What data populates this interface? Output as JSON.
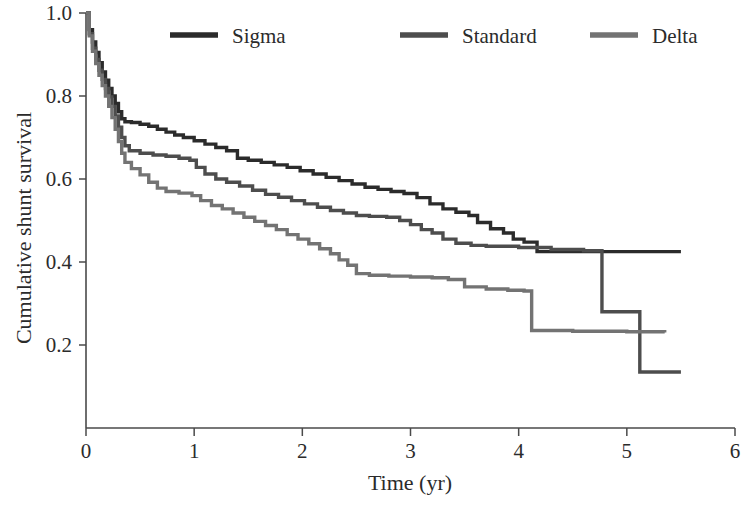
{
  "chart_data": {
    "type": "line",
    "plot_style": "kaplan-meier step survival curves",
    "title": "",
    "xlabel": "Time (yr)",
    "ylabel": "Cumulative shunt survival",
    "xlim": [
      0,
      6
    ],
    "ylim": [
      0,
      1.0
    ],
    "xticks": [
      0,
      1,
      2,
      3,
      4,
      5,
      6
    ],
    "xtick_labels": [
      "0",
      "1",
      "2",
      "3",
      "4",
      "5",
      "6"
    ],
    "yticks": [
      0.2,
      0.4,
      0.6,
      0.8,
      1.0
    ],
    "ytick_labels": [
      "0.2",
      "0.4",
      "0.6",
      "0.8",
      "1.0"
    ],
    "grid": false,
    "legend_position": "top-center",
    "colors": {
      "sigma": "#2b2b2b",
      "standard": "#4d4d4d",
      "delta": "#737373",
      "axis": "#4a4a4a"
    },
    "series": [
      {
        "name": "Sigma",
        "color": "#2b2b2b",
        "points": [
          [
            0.0,
            1.0
          ],
          [
            0.03,
            0.96
          ],
          [
            0.06,
            0.93
          ],
          [
            0.09,
            0.905
          ],
          [
            0.12,
            0.88
          ],
          [
            0.15,
            0.858
          ],
          [
            0.18,
            0.838
          ],
          [
            0.21,
            0.818
          ],
          [
            0.24,
            0.8
          ],
          [
            0.27,
            0.782
          ],
          [
            0.3,
            0.762
          ],
          [
            0.33,
            0.745
          ],
          [
            0.36,
            0.738
          ],
          [
            0.42,
            0.736
          ],
          [
            0.5,
            0.732
          ],
          [
            0.58,
            0.727
          ],
          [
            0.66,
            0.72
          ],
          [
            0.74,
            0.713
          ],
          [
            0.82,
            0.706
          ],
          [
            0.9,
            0.7
          ],
          [
            1.0,
            0.692
          ],
          [
            1.1,
            0.684
          ],
          [
            1.2,
            0.676
          ],
          [
            1.3,
            0.668
          ],
          [
            1.4,
            0.65
          ],
          [
            1.5,
            0.645
          ],
          [
            1.62,
            0.64
          ],
          [
            1.74,
            0.634
          ],
          [
            1.86,
            0.628
          ],
          [
            1.98,
            0.62
          ],
          [
            2.1,
            0.612
          ],
          [
            2.22,
            0.604
          ],
          [
            2.34,
            0.596
          ],
          [
            2.46,
            0.588
          ],
          [
            2.58,
            0.58
          ],
          [
            2.7,
            0.575
          ],
          [
            2.82,
            0.57
          ],
          [
            2.94,
            0.565
          ],
          [
            3.06,
            0.555
          ],
          [
            3.18,
            0.54
          ],
          [
            3.3,
            0.528
          ],
          [
            3.42,
            0.52
          ],
          [
            3.54,
            0.512
          ],
          [
            3.62,
            0.495
          ],
          [
            3.74,
            0.48
          ],
          [
            3.86,
            0.47
          ],
          [
            3.95,
            0.455
          ],
          [
            4.05,
            0.448
          ],
          [
            4.17,
            0.425
          ],
          [
            5.5,
            0.425
          ]
        ]
      },
      {
        "name": "Standard",
        "color": "#4d4d4d",
        "points": [
          [
            0.0,
            1.0
          ],
          [
            0.03,
            0.95
          ],
          [
            0.06,
            0.915
          ],
          [
            0.09,
            0.888
          ],
          [
            0.12,
            0.862
          ],
          [
            0.15,
            0.84
          ],
          [
            0.18,
            0.818
          ],
          [
            0.21,
            0.798
          ],
          [
            0.24,
            0.775
          ],
          [
            0.27,
            0.752
          ],
          [
            0.3,
            0.725
          ],
          [
            0.33,
            0.7
          ],
          [
            0.36,
            0.68
          ],
          [
            0.4,
            0.668
          ],
          [
            0.5,
            0.662
          ],
          [
            0.62,
            0.658
          ],
          [
            0.74,
            0.655
          ],
          [
            0.86,
            0.65
          ],
          [
            0.96,
            0.645
          ],
          [
            1.02,
            0.628
          ],
          [
            1.1,
            0.612
          ],
          [
            1.2,
            0.6
          ],
          [
            1.3,
            0.592
          ],
          [
            1.42,
            0.583
          ],
          [
            1.54,
            0.573
          ],
          [
            1.66,
            0.563
          ],
          [
            1.78,
            0.556
          ],
          [
            1.9,
            0.548
          ],
          [
            2.02,
            0.54
          ],
          [
            2.14,
            0.532
          ],
          [
            2.26,
            0.524
          ],
          [
            2.38,
            0.518
          ],
          [
            2.5,
            0.512
          ],
          [
            2.62,
            0.51
          ],
          [
            2.78,
            0.508
          ],
          [
            2.9,
            0.5
          ],
          [
            3.0,
            0.49
          ],
          [
            3.1,
            0.478
          ],
          [
            3.2,
            0.47
          ],
          [
            3.3,
            0.455
          ],
          [
            3.42,
            0.445
          ],
          [
            3.56,
            0.44
          ],
          [
            3.7,
            0.438
          ],
          [
            4.0,
            0.435
          ],
          [
            4.3,
            0.43
          ],
          [
            4.6,
            0.427
          ],
          [
            4.77,
            0.425
          ],
          [
            4.77,
            0.28
          ],
          [
            5.12,
            0.28
          ],
          [
            5.12,
            0.135
          ],
          [
            5.5,
            0.135
          ]
        ]
      },
      {
        "name": "Delta",
        "color": "#737373",
        "points": [
          [
            0.0,
            1.0
          ],
          [
            0.03,
            0.945
          ],
          [
            0.06,
            0.908
          ],
          [
            0.09,
            0.878
          ],
          [
            0.12,
            0.85
          ],
          [
            0.15,
            0.825
          ],
          [
            0.18,
            0.8
          ],
          [
            0.21,
            0.775
          ],
          [
            0.24,
            0.748
          ],
          [
            0.27,
            0.72
          ],
          [
            0.3,
            0.69
          ],
          [
            0.33,
            0.662
          ],
          [
            0.36,
            0.64
          ],
          [
            0.42,
            0.625
          ],
          [
            0.5,
            0.61
          ],
          [
            0.58,
            0.592
          ],
          [
            0.66,
            0.578
          ],
          [
            0.74,
            0.57
          ],
          [
            0.86,
            0.566
          ],
          [
            0.98,
            0.56
          ],
          [
            1.06,
            0.548
          ],
          [
            1.16,
            0.536
          ],
          [
            1.26,
            0.528
          ],
          [
            1.36,
            0.518
          ],
          [
            1.46,
            0.508
          ],
          [
            1.56,
            0.498
          ],
          [
            1.66,
            0.488
          ],
          [
            1.76,
            0.478
          ],
          [
            1.86,
            0.466
          ],
          [
            1.96,
            0.455
          ],
          [
            2.06,
            0.444
          ],
          [
            2.16,
            0.432
          ],
          [
            2.26,
            0.42
          ],
          [
            2.34,
            0.405
          ],
          [
            2.42,
            0.392
          ],
          [
            2.5,
            0.372
          ],
          [
            2.62,
            0.368
          ],
          [
            2.8,
            0.366
          ],
          [
            3.0,
            0.364
          ],
          [
            3.2,
            0.362
          ],
          [
            3.35,
            0.358
          ],
          [
            3.5,
            0.34
          ],
          [
            3.7,
            0.335
          ],
          [
            3.9,
            0.332
          ],
          [
            4.05,
            0.33
          ],
          [
            4.12,
            0.235
          ],
          [
            4.5,
            0.233
          ],
          [
            5.0,
            0.232
          ],
          [
            5.35,
            0.23
          ]
        ]
      }
    ],
    "legend": [
      {
        "label": "Sigma",
        "color": "#2b2b2b"
      },
      {
        "label": "Standard",
        "color": "#4d4d4d"
      },
      {
        "label": "Delta",
        "color": "#737373"
      }
    ]
  },
  "axes": {
    "x_axis_name": "time-axis",
    "y_axis_name": "survival-axis"
  }
}
